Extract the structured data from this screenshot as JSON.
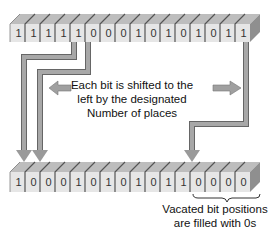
{
  "diagram": {
    "type": "left-shift-illustration",
    "shift_amount": 4,
    "colors": {
      "face": "#e6e6e6",
      "top": "#bdbdbd",
      "side": "#8f8f8f",
      "arrow": "#9a9a9a",
      "arrow_edge": "#666666",
      "text": "#111111"
    },
    "top_row": {
      "label": "original value",
      "bits": [
        "1",
        "1",
        "1",
        "1",
        "1",
        "0",
        "0",
        "0",
        "1",
        "0",
        "1",
        "0",
        "1",
        "0",
        "1",
        "1"
      ]
    },
    "bottom_row": {
      "label": "shifted value",
      "bits": [
        "1",
        "0",
        "0",
        "0",
        "1",
        "0",
        "1",
        "0",
        "1",
        "0",
        "1",
        "1",
        "0",
        "0",
        "0",
        "0"
      ]
    },
    "main_caption": {
      "line1": "Each bit is shifted to the",
      "line2": "left by the designated",
      "line3": "Number of places"
    },
    "vacated_caption": {
      "line1": "Vacated bit positions",
      "line2": "are filled with 0s"
    },
    "icons": {
      "left_arrow": "left-arrow-icon",
      "right_arrow": "right-arrow-icon",
      "brace": "curly-brace-icon"
    }
  }
}
